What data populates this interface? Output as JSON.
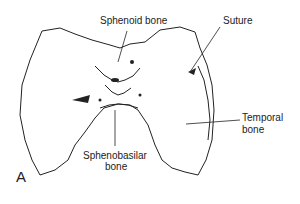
{
  "figure": {
    "panel_label": "A",
    "labels": {
      "sphenoid": "Sphenoid bone",
      "suture": "Suture",
      "temporal_line1": "Temporal",
      "temporal_line2": "bone",
      "sphenobasilar_line1": "Sphenobasilar",
      "sphenobasilar_line2": "bone"
    }
  }
}
